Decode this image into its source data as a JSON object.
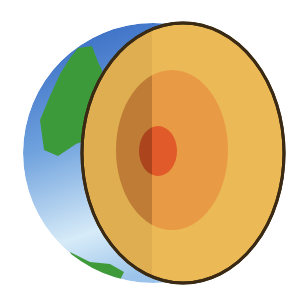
{
  "diagram": {
    "layers": [
      {
        "name": "crust",
        "color": "#e9b552"
      },
      {
        "name": "mantle",
        "color": "#e69a42"
      },
      {
        "name": "core",
        "color": "#e05a2a"
      }
    ],
    "surface": {
      "ocean_top": "#3c74c8",
      "ocean_bottom": "#d8ecf8",
      "land": "#3f9a3a"
    },
    "outline_color": "#3a2a14",
    "shade_color": "#000000"
  }
}
